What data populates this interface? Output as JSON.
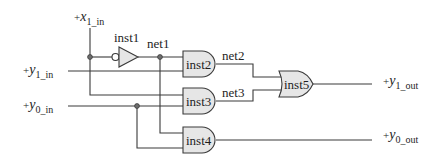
{
  "diagram": {
    "type": "logic-circuit",
    "inputs": [
      {
        "id": "x1_in",
        "prefix": "+",
        "base": "x",
        "sub": "1_in"
      },
      {
        "id": "y1_in",
        "prefix": "+",
        "base": "y",
        "sub": "1_in"
      },
      {
        "id": "y0_in",
        "prefix": "+",
        "base": "y",
        "sub": "0_in"
      }
    ],
    "outputs": [
      {
        "id": "y1_out",
        "prefix": "+",
        "base": "y",
        "sub": "1_out"
      },
      {
        "id": "y0_out",
        "prefix": "+",
        "base": "y",
        "sub": "0_out"
      }
    ],
    "instances": [
      {
        "name": "inst1",
        "type": "NOT"
      },
      {
        "name": "inst2",
        "type": "AND"
      },
      {
        "name": "inst3",
        "type": "AND"
      },
      {
        "name": "inst4",
        "type": "AND"
      },
      {
        "name": "inst5",
        "type": "OR"
      }
    ],
    "nets": [
      {
        "name": "net1"
      },
      {
        "name": "net2"
      },
      {
        "name": "net3"
      }
    ]
  }
}
